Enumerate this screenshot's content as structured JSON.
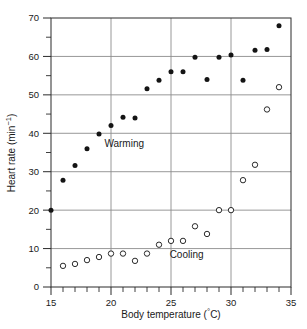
{
  "figure": {
    "top_fragment": "",
    "xlabel_main": "Body temperature (",
    "xlabel_unit": "°C",
    "xlabel_close": ")",
    "ylabel_main": "Heart rate (min",
    "ylabel_sup": "−1",
    "ylabel_close": ")"
  },
  "chart_data": {
    "type": "scatter",
    "title": "",
    "xlabel": "Body temperature (°C)",
    "ylabel": "Heart rate (min⁻¹)",
    "xlim": [
      15,
      35
    ],
    "ylim": [
      0,
      70
    ],
    "xticks": [
      15,
      20,
      25,
      30,
      35
    ],
    "yticks": [
      0,
      10,
      20,
      30,
      40,
      50,
      60,
      70
    ],
    "xtick_labels": [
      "15",
      "20",
      "25",
      "30",
      "35"
    ],
    "ytick_labels": [
      "0",
      "10",
      "20",
      "30",
      "40",
      "50",
      "60",
      "70"
    ],
    "x_minor_step": 1,
    "y_minor_step": 5,
    "grid": true,
    "grid_axes": "both-major",
    "legend": "none",
    "annotations": [
      {
        "text": "Warming",
        "x": 21.1,
        "y": 36.5
      },
      {
        "text": "Cooling",
        "x": 26.3,
        "y": 7.6
      }
    ],
    "series": [
      {
        "name": "Warming",
        "marker": "filled-circle",
        "color": "#141414",
        "points": [
          [
            15,
            20.0
          ],
          [
            16,
            27.8
          ],
          [
            17,
            31.6
          ],
          [
            18,
            36.0
          ],
          [
            19,
            39.8
          ],
          [
            20,
            42.0
          ],
          [
            21,
            44.2
          ],
          [
            22,
            44.0
          ],
          [
            23,
            51.6
          ],
          [
            24,
            53.8
          ],
          [
            25,
            56.0
          ],
          [
            26,
            56.0
          ],
          [
            27,
            59.8
          ],
          [
            28,
            54.0
          ],
          [
            29,
            59.8
          ],
          [
            30,
            60.4
          ],
          [
            31,
            53.8
          ],
          [
            32,
            61.6
          ],
          [
            33,
            61.8
          ],
          [
            34,
            68.0
          ]
        ]
      },
      {
        "name": "Cooling",
        "marker": "open-circle",
        "color": "#141414",
        "points": [
          [
            16,
            5.5
          ],
          [
            17,
            6.0
          ],
          [
            18,
            7.0
          ],
          [
            19,
            7.8
          ],
          [
            20,
            8.7
          ],
          [
            21,
            8.7
          ],
          [
            22,
            6.8
          ],
          [
            23,
            8.7
          ],
          [
            24,
            11.0
          ],
          [
            25,
            12.0
          ],
          [
            26,
            12.0
          ],
          [
            27,
            15.8
          ],
          [
            28,
            13.8
          ],
          [
            29,
            20.0
          ],
          [
            30,
            20.0
          ],
          [
            31,
            27.8
          ],
          [
            32,
            31.8
          ],
          [
            33,
            46.2
          ],
          [
            34,
            52.0
          ]
        ]
      }
    ]
  }
}
